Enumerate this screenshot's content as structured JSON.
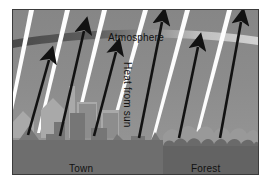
{
  "diagram": {
    "labels": {
      "atmosphere": "Atmosphere",
      "heat_from_sun": "Heat from sun",
      "town": "Town",
      "forest": "Forest"
    },
    "colors": {
      "background": "#ffffff",
      "border": "#3b3b3b",
      "sky": "#8a8a8a",
      "sky_upper": "#878787",
      "sky_lower": "#949494",
      "atmosphere_band_dark": "#4f4f4f",
      "atmosphere_band_light": "#c8c8c8",
      "sun_ray": "#fdfdfd",
      "arrow": "#121212",
      "town_ground": "#6e6e6e",
      "forest_ground": "#636363",
      "building_light": "#b4b4b4",
      "building_mid": "#9c9c9c",
      "building_dark": "#777777",
      "tree_light": "#9a9a9a",
      "tree_dark": "#6b6b6b",
      "label_text": "#111111"
    },
    "elements": {
      "sun_ray_count": 6,
      "heat_arrow_count": 6,
      "sun_ray_direction": "down-left",
      "heat_arrow_direction": "up-right"
    },
    "sun_rays": [
      {
        "top_x": 30,
        "bottom_x": 2,
        "width": 5
      },
      {
        "top_x": 66,
        "bottom_x": 35,
        "width": 5
      },
      {
        "top_x": 103,
        "bottom_x": 70,
        "width": 5
      },
      {
        "top_x": 143,
        "bottom_x": 104,
        "width": 5
      },
      {
        "top_x": 185,
        "bottom_x": 148,
        "width": 5
      },
      {
        "top_x": 227,
        "bottom_x": 193,
        "width": 5
      }
    ],
    "heat_arrows": [
      {
        "base_x": 26,
        "base_y": 131,
        "tip_x": 48,
        "tip_y": 55
      },
      {
        "base_x": 59,
        "base_y": 131,
        "tip_x": 82,
        "tip_y": 26
      },
      {
        "base_x": 93,
        "base_y": 131,
        "tip_x": 114,
        "tip_y": 47
      },
      {
        "base_x": 138,
        "base_y": 131,
        "tip_x": 160,
        "tip_y": 16
      },
      {
        "base_x": 178,
        "base_y": 131,
        "tip_x": 196,
        "tip_y": 42
      },
      {
        "base_x": 218,
        "base_y": 131,
        "tip_x": 238,
        "tip_y": 16
      }
    ]
  }
}
